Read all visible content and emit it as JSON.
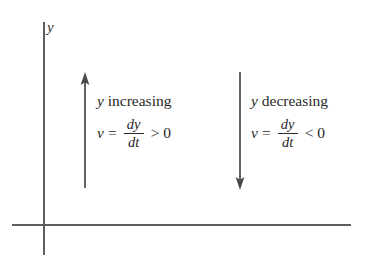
{
  "figure": {
    "background_color": "#ffffff",
    "axis_color": "#5e5e5e",
    "text_color": "#2a2a2a",
    "arrow_color": "#4a4a4a"
  },
  "axes": {
    "y_axis_label": "y",
    "x_axis_label": ""
  },
  "arrows": {
    "up": {
      "direction": "up",
      "name": "upward-velocity-arrow"
    },
    "down": {
      "direction": "down",
      "name": "downward-velocity-arrow"
    }
  },
  "annotations": [
    {
      "caption_variable": "y",
      "caption_text": "increasing",
      "equation": {
        "lhs": "v",
        "equals": "=",
        "numerator": "dy",
        "denominator": "dt",
        "relation": "> 0"
      }
    },
    {
      "caption_variable": "y",
      "caption_text": "decreasing",
      "equation": {
        "lhs": "v",
        "equals": "=",
        "numerator": "dy",
        "denominator": "dt",
        "relation": "< 0"
      }
    }
  ]
}
